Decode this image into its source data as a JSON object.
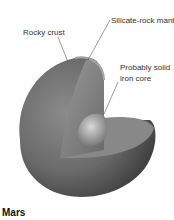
{
  "diagram": {
    "title": "Mars",
    "labels": [
      {
        "id": "crust",
        "text": "Rocky crust"
      },
      {
        "id": "mantle",
        "text": "Silicate-rock mantle"
      },
      {
        "id": "core_line1",
        "text": "Probably solid"
      },
      {
        "id": "core_line2",
        "text": "iron core"
      }
    ],
    "colors": {
      "surface": "#6e6e6e",
      "mantle_cut": "#8a8a8a",
      "core": "#b5b5b5",
      "leader_line": "#555555"
    }
  }
}
